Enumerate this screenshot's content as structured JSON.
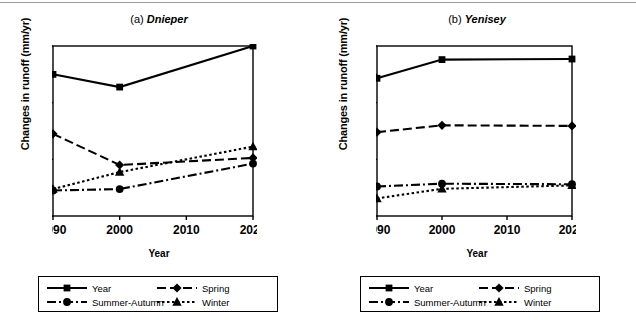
{
  "figure": {
    "ylabel": "Changes in runoff (mm/yr)",
    "xlabel": "Year"
  },
  "panels": [
    {
      "id": "a",
      "prefix": "(a)",
      "name": "Dnieper",
      "ylabel": "Changes in runoff (mm/yr)",
      "xlabel": "Year"
    },
    {
      "id": "b",
      "prefix": "(b)",
      "name": "Yenisey",
      "ylabel": "Changes in runoff (mm/yr)",
      "xlabel": "Year"
    }
  ],
  "legend": {
    "entries": [
      {
        "label": "Year",
        "marker": "square",
        "dash": "solid"
      },
      {
        "label": "Spring",
        "marker": "diamond",
        "dash": "dashed"
      },
      {
        "label": "Summer-Autumn",
        "marker": "circle",
        "dash": "dashdot"
      },
      {
        "label": "Winter",
        "marker": "triangle",
        "dash": "dotted"
      }
    ]
  },
  "chart_data": [
    {
      "type": "line",
      "title": "(a) Dnieper",
      "xlabel": "Year",
      "ylabel": "Changes in runoff (mm/yr)",
      "x": [
        1990,
        2000,
        2020
      ],
      "xticks": [
        1990,
        2000,
        2010,
        2020
      ],
      "xlim": [
        1990,
        2020
      ],
      "ylim": [
        0,
        120
      ],
      "yticks": [
        0,
        20,
        40,
        60,
        80,
        100,
        120
      ],
      "grid": false,
      "legend_position": "bottom",
      "series": [
        {
          "name": "Year",
          "values": [
            100,
            91,
            120
          ],
          "marker": "square",
          "dash": "solid"
        },
        {
          "name": "Spring",
          "values": [
            58,
            36,
            41
          ],
          "marker": "diamond",
          "dash": "dashed"
        },
        {
          "name": "Summer-Autumn",
          "values": [
            18,
            19,
            37
          ],
          "marker": "circle",
          "dash": "dashdot"
        },
        {
          "name": "Winter",
          "values": [
            19,
            31,
            49
          ],
          "marker": "triangle",
          "dash": "dotted"
        }
      ]
    },
    {
      "type": "line",
      "title": "(b) Yenisey",
      "xlabel": "Year",
      "ylabel": "Changes in runoff (mm/yr)",
      "x": [
        1990,
        2000,
        2020
      ],
      "xticks": [
        1990,
        2000,
        2010,
        2020
      ],
      "xlim": [
        1990,
        2020
      ],
      "ylim": [
        0,
        300
      ],
      "yticks": [
        0,
        50,
        100,
        150,
        200,
        250,
        300
      ],
      "grid": false,
      "legend_position": "bottom",
      "series": [
        {
          "name": "Year",
          "values": [
            243,
            276,
            277
          ],
          "marker": "square",
          "dash": "solid"
        },
        {
          "name": "Spring",
          "values": [
            148,
            160,
            159
          ],
          "marker": "diamond",
          "dash": "dashed"
        },
        {
          "name": "Summer-Autumn",
          "values": [
            52,
            57,
            56
          ],
          "marker": "circle",
          "dash": "dashdot"
        },
        {
          "name": "Winter",
          "values": [
            31,
            48,
            54
          ],
          "marker": "triangle",
          "dash": "dotted"
        }
      ]
    }
  ]
}
